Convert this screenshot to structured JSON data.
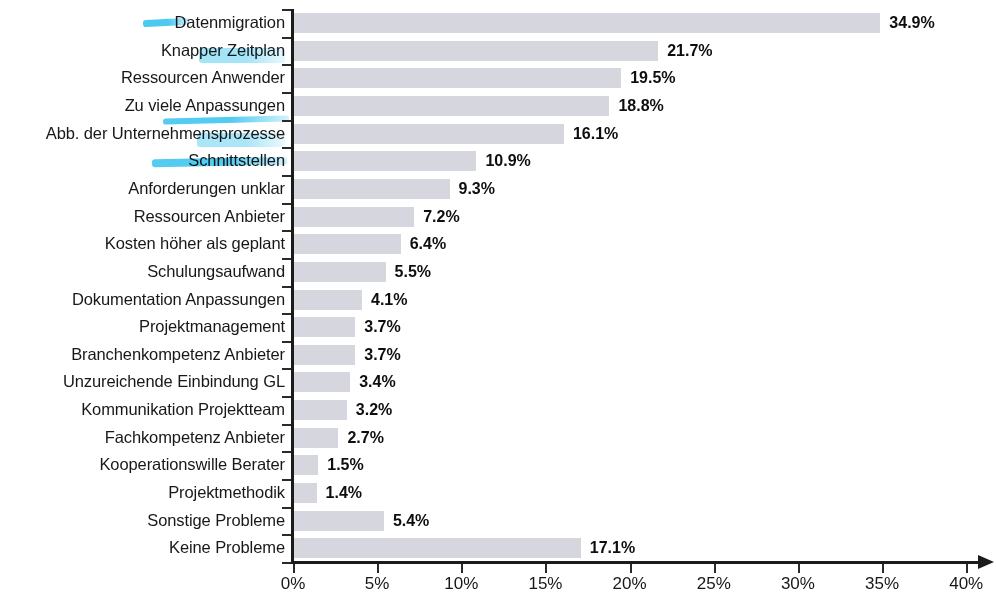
{
  "chart_data": {
    "type": "bar",
    "orientation": "horizontal",
    "title": "",
    "subtitle": "",
    "xlabel": "",
    "ylabel": "",
    "xlim": [
      0,
      40
    ],
    "xtick_labels": [
      "0%",
      "5%",
      "10%",
      "15%",
      "20%",
      "25%",
      "30%",
      "35%",
      "40%"
    ],
    "xticks": [
      0,
      5,
      10,
      15,
      20,
      25,
      30,
      35,
      40
    ],
    "grid": false,
    "legend": null,
    "value_suffix": "%",
    "categories": [
      "Datenmigration",
      "Knapper Zeitplan",
      "Ressourcen Anwender",
      "Zu viele Anpassungen",
      "Abb. der Unternehmensprozesse",
      "Schnittstellen",
      "Anforderungen unklar",
      "Ressourcen Anbieter",
      "Kosten höher als geplant",
      "Schulungsaufwand",
      "Dokumentation Anpassungen",
      "Projektmanagement",
      "Branchenkompetenz Anbieter",
      "Unzureichende Einbindung GL",
      "Kommunikation Projektteam",
      "Fachkompetenz Anbieter",
      "Kooperationswille Berater",
      "Projektmethodik",
      "Sonstige Probleme",
      "Keine Probleme"
    ],
    "values": [
      34.9,
      21.7,
      19.5,
      18.8,
      16.1,
      10.9,
      9.3,
      7.2,
      6.4,
      5.5,
      4.1,
      3.7,
      3.7,
      3.4,
      3.2,
      2.7,
      1.5,
      1.4,
      5.4,
      17.1
    ],
    "value_labels": [
      "34.9%",
      "21.7%",
      "19.5%",
      "18.8%",
      "16.1%",
      "10.9%",
      "9.3%",
      "7.2%",
      "6.4%",
      "5.5%",
      "4.1%",
      "3.7%",
      "3.7%",
      "3.4%",
      "3.2%",
      "2.7%",
      "1.5%",
      "1.4%",
      "5.4%",
      "17.1%"
    ],
    "bar_color": "#d6d6de",
    "axis_color": "#1b1b1b",
    "label_color": "#17181a"
  },
  "annotations": {
    "highlighter_color": "#41c6ef",
    "marks": [
      {
        "name": "highlight-datenmigration",
        "x": 143,
        "y": 19,
        "w": 46,
        "h": 7,
        "rot": -3,
        "opacity": 0.95
      },
      {
        "name": "highlight-zeitplan",
        "x": 199,
        "y": 48,
        "w": 86,
        "h": 15,
        "rot": 0,
        "opacity": 0.48
      },
      {
        "name": "highlight-anpassungen",
        "x": 163,
        "y": 117,
        "w": 126,
        "h": 6,
        "rot": -1.5,
        "opacity": 0.9
      },
      {
        "name": "highlight-prozesse",
        "x": 197,
        "y": 133,
        "w": 88,
        "h": 14,
        "rot": 0,
        "opacity": 0.45
      },
      {
        "name": "highlight-schnittstellen",
        "x": 152,
        "y": 158,
        "w": 135,
        "h": 8,
        "rot": -1,
        "opacity": 0.9
      }
    ]
  }
}
